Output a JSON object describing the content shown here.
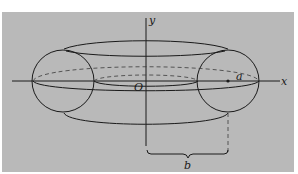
{
  "figure": {
    "background": "#b9b9b9",
    "stroke": "#1a1a1a"
  },
  "labels": {
    "x_axis": "x",
    "y_axis": "y",
    "origin": "O",
    "radius": "a",
    "distance": "b"
  }
}
